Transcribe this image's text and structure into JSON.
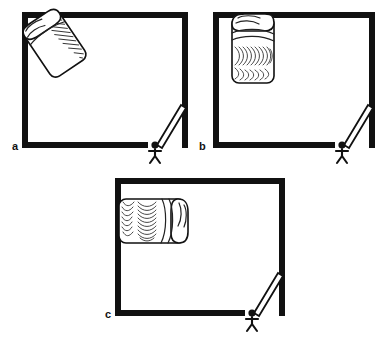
{
  "figure": {
    "background_color": "#ffffff",
    "ink_color": "#111111",
    "width": 391,
    "height": 340,
    "panels": [
      {
        "id": "a",
        "label": "a",
        "label_x": 12,
        "label_y": 150,
        "room": {
          "x": 22,
          "y": 12,
          "width": 166,
          "height": 136,
          "wall_thickness": 6,
          "door_gap": {
            "start_x": 148,
            "end_x": 166
          }
        },
        "bed": {
          "orientation": "diagonal",
          "description": "bed tilted diagonally in upper-left corner of room, headboard pillow at upper-left",
          "center_x": 55,
          "center_y": 44,
          "rotation_deg": -34
        },
        "door": {
          "description": "door leaf swung open inward from bottom-right corner",
          "hinge_x": 182,
          "hinge_y": 108,
          "tip_x": 160,
          "tip_y": 146
        },
        "person": {
          "description": "stick figure standing outside the doorway",
          "x": 155,
          "y": 148
        }
      },
      {
        "id": "b",
        "label": "b",
        "label_x": 199,
        "label_y": 150,
        "room": {
          "x": 213,
          "y": 12,
          "width": 162,
          "height": 136,
          "wall_thickness": 6,
          "door_gap": {
            "start_x": 335,
            "end_x": 353
          }
        },
        "bed": {
          "orientation": "vertical",
          "description": "bed upright against top wall, head of bed at top touching wall",
          "center_x": 253,
          "center_y": 46,
          "rotation_deg": 0
        },
        "door": {
          "description": "door leaf swung open inward from bottom-right corner",
          "hinge_x": 369,
          "hinge_y": 108,
          "tip_x": 347,
          "tip_y": 146
        },
        "person": {
          "description": "stick figure standing outside the doorway",
          "x": 342,
          "y": 148
        }
      },
      {
        "id": "c",
        "label": "c",
        "label_x": 105,
        "label_y": 318,
        "room": {
          "x": 115,
          "y": 178,
          "width": 170,
          "height": 138,
          "wall_thickness": 6,
          "door_gap": {
            "start_x": 245,
            "end_x": 263
          }
        },
        "bed": {
          "orientation": "horizontal",
          "description": "bed lying sideways against left wall, head of bed at left touching wall",
          "center_x": 155,
          "center_y": 219,
          "rotation_deg": 90
        },
        "door": {
          "description": "door leaf swung open inward from bottom-right corner",
          "hinge_x": 279,
          "hinge_y": 276,
          "tip_x": 257,
          "tip_y": 314
        },
        "person": {
          "description": "stick figure standing outside the doorway",
          "x": 252,
          "y": 316
        }
      }
    ]
  }
}
